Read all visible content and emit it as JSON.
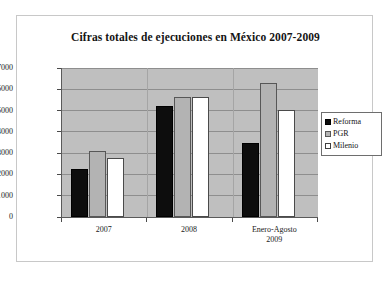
{
  "chart_data": {
    "type": "bar",
    "title": "Cifras totales de ejecuciones en México 2007-2009",
    "xlabel": "",
    "ylabel": "",
    "categories": [
      "2007",
      "2008",
      "Enero-Agosto 2009"
    ],
    "category_lines": [
      [
        "2007"
      ],
      [
        "2008"
      ],
      [
        "Enero-Agosto",
        "2009"
      ]
    ],
    "series": [
      {
        "name": "Reforma",
        "color": "#0d0d0d",
        "values": [
          2250,
          5200,
          3500
        ]
      },
      {
        "name": "PGR",
        "color": "#b3b3b3",
        "values": [
          3100,
          5650,
          6300
        ]
      },
      {
        "name": "Milenio",
        "color": "#ffffff",
        "values": [
          2780,
          5650,
          5050
        ]
      }
    ],
    "ylim": [
      0,
      7000
    ],
    "ytick_values": [
      0,
      1000,
      2000,
      3000,
      4000,
      5000,
      6000,
      7000
    ],
    "ytick_labels": [
      "0",
      "1000",
      "2000",
      "3000",
      "4000",
      "5000",
      "6000",
      "7000"
    ],
    "grid": true,
    "legend_position": "right",
    "plot_background": "#bfbfbf",
    "figure_background": "#ffffff",
    "frame_color": "#c8c8c8"
  },
  "legend": {
    "items": [
      {
        "label": "Reforma",
        "swatch": "black-square-icon"
      },
      {
        "label": "PGR",
        "swatch": "gray-square-icon"
      },
      {
        "label": "Milenio",
        "swatch": "white-square-icon"
      }
    ]
  }
}
